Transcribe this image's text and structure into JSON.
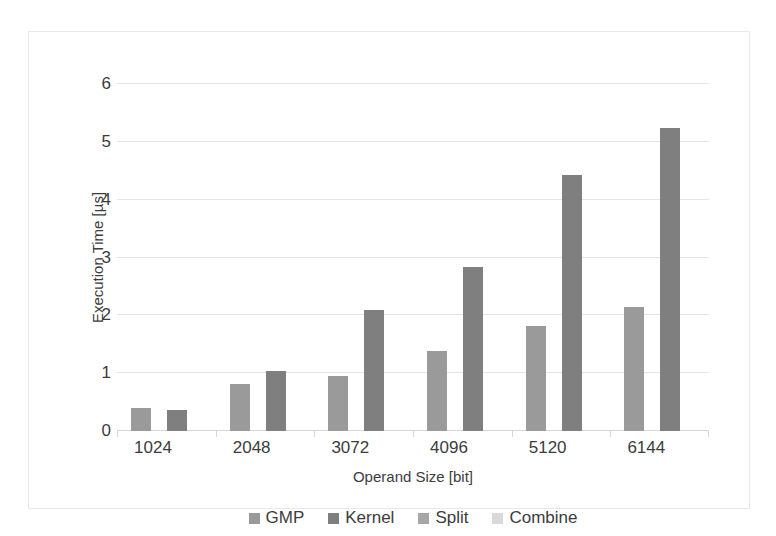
{
  "chart_data": {
    "type": "bar",
    "title": "",
    "xlabel": "Operand Size [bit]",
    "ylabel": "Execution Time [µs]",
    "categories": [
      "1024",
      "2048",
      "3072",
      "4096",
      "5120",
      "6144"
    ],
    "series": [
      {
        "name": "GMP",
        "color": "#9a9a9a",
        "values": [
          0.4,
          0.81,
          0.95,
          1.38,
          1.81,
          2.14
        ]
      },
      {
        "name": "Kernel",
        "color": "#7f7f7f",
        "values": [
          0.36,
          1.04,
          2.09,
          2.84,
          4.42,
          5.24
        ]
      },
      {
        "name": "Split",
        "color": "#a6a6a6",
        "values": [
          null,
          null,
          null,
          null,
          null,
          null
        ]
      },
      {
        "name": "Combine",
        "color": "#d9d9d9",
        "values": [
          null,
          null,
          null,
          null,
          null,
          null
        ]
      }
    ],
    "ylim": [
      0,
      6
    ],
    "ytick_values": [
      "6",
      "5",
      "4",
      "3",
      "2",
      "1",
      "0"
    ],
    "ytick_numbers": [
      6,
      5,
      4,
      3,
      2,
      1,
      0
    ],
    "grid": "horizontal",
    "legend_position": "bottom",
    "legend_entries": [
      "GMP",
      "Kernel",
      "Split",
      "Combine"
    ],
    "annotations": []
  },
  "colors": {
    "plot_background": "#ffffff",
    "gridline": "#e4e4e4",
    "axis_line": "#d6d6d6",
    "text": "#3c3c3c",
    "frame": "#e9e9e9"
  }
}
